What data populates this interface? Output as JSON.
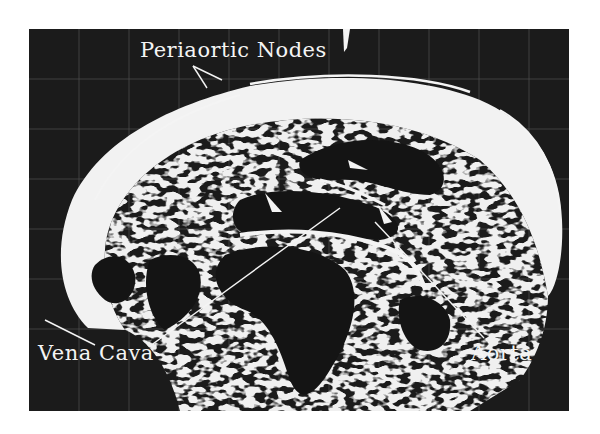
{
  "image": {
    "type": "ultrasound-scan",
    "subject": "abdominal transverse section",
    "colors": {
      "background": "#1b1b1b",
      "tissue": "#f2f2f2",
      "page": "#ffffff"
    }
  },
  "labels": {
    "periaortic_nodes": "Periaortic Nodes",
    "vena_cava": "Vena Cava",
    "aorta": "Aorta"
  }
}
